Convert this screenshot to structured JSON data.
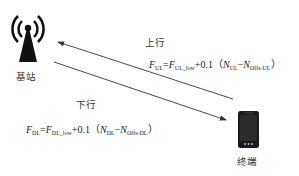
{
  "diagram": {
    "base_station": {
      "label": "基站",
      "icon": "cell-tower-icon"
    },
    "terminal": {
      "label": "终端",
      "icon": "smartphone-icon"
    },
    "uplink": {
      "label": "上行",
      "direction": "terminal-to-base-station",
      "formula": {
        "lhs_var": "F",
        "lhs_sub": "UL",
        "eq": "=",
        "f_var": "F",
        "f_sub": "UL_low",
        "plus": "+0.1（",
        "n1_var": "N",
        "n1_sub": "UL",
        "minus": "−",
        "n2_var": "N",
        "n2_sub": "Offs-UL",
        "close": "）"
      }
    },
    "downlink": {
      "label": "下行",
      "direction": "base-station-to-terminal",
      "formula": {
        "lhs_var": "F",
        "lhs_sub": "DL",
        "eq": "=",
        "f_var": "F",
        "f_sub": "DL_low",
        "plus": "+0.1（",
        "n1_var": "N",
        "n1_sub": "DL",
        "minus": "−",
        "n2_var": "N",
        "n2_sub": "Offs-DL",
        "close": "）"
      }
    },
    "colors": {
      "line": "#333333",
      "icon": "#111111",
      "background": "#ffffff"
    }
  }
}
